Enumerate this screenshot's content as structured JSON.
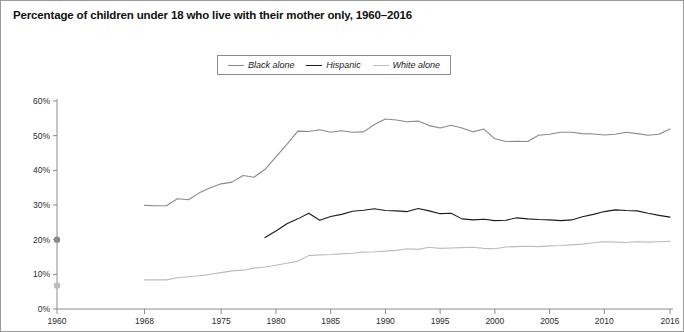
{
  "figure": {
    "title": "Percentage of children under 18 who live with their mother only, 1960–2016",
    "border_color": "#9a9a9a",
    "background": "#ffffff"
  },
  "legend": {
    "position": "top-center",
    "entries": [
      {
        "label": "Black alone",
        "color": "#8a8a8a",
        "swatch": "line-swatch"
      },
      {
        "label": "Hispanic",
        "color": "#1c1c1c",
        "swatch": "line-swatch"
      },
      {
        "label": "White alone",
        "color": "#bdbdbd",
        "swatch": "line-swatch"
      }
    ]
  },
  "axes": {
    "y": {
      "label": "",
      "ticks": [
        "0%",
        "10%",
        "20%",
        "30%",
        "40%",
        "50%",
        "60%"
      ],
      "min": 0,
      "max": 60
    },
    "x": {
      "label": "",
      "ticks": [
        "1960",
        "1968",
        "1975",
        "1980",
        "1985",
        "1990",
        "1995",
        "2000",
        "2005",
        "2010",
        "2016"
      ],
      "min": 1960,
      "max": 2016
    }
  },
  "chart_data": {
    "type": "line",
    "title": "Percentage of children under 18 who live with their mother only, 1960–2016",
    "xlabel": "",
    "ylabel": "",
    "xlim": [
      1960,
      2016
    ],
    "ylim": [
      0,
      60
    ],
    "grid": false,
    "legend_position": "top-center",
    "y_tick_values": [
      0,
      10,
      20,
      30,
      40,
      50,
      60
    ],
    "y_tick_labels": [
      "0%",
      "10%",
      "20%",
      "30%",
      "40%",
      "50%",
      "60%"
    ],
    "x_tick_values": [
      1960,
      1968,
      1975,
      1980,
      1985,
      1990,
      1995,
      2000,
      2005,
      2010,
      2016
    ],
    "x_tick_labels": [
      "1960",
      "1968",
      "1975",
      "1980",
      "1985",
      "1990",
      "1995",
      "2000",
      "2005",
      "2010",
      "2016"
    ],
    "series": [
      {
        "name": "Black alone",
        "color": "#8a8a8a",
        "marker_points": [
          {
            "x": 1960,
            "y": 20.0
          }
        ],
        "x": [
          1968,
          1969,
          1970,
          1971,
          1972,
          1973,
          1974,
          1975,
          1976,
          1977,
          1978,
          1979,
          1980,
          1981,
          1982,
          1983,
          1984,
          1985,
          1986,
          1987,
          1988,
          1989,
          1990,
          1991,
          1992,
          1993,
          1994,
          1995,
          1996,
          1997,
          1998,
          1999,
          2000,
          2001,
          2002,
          2003,
          2004,
          2005,
          2006,
          2007,
          2008,
          2009,
          2010,
          2011,
          2012,
          2013,
          2014,
          2015,
          2016
        ],
        "y": [
          29.9,
          29.8,
          29.8,
          31.8,
          31.5,
          33.5,
          35.0,
          36.1,
          36.6,
          38.5,
          38.0,
          40.3,
          43.9,
          47.5,
          51.3,
          51.2,
          51.7,
          51.0,
          51.4,
          51.0,
          51.1,
          53.2,
          54.8,
          54.5,
          54.0,
          54.2,
          52.9,
          52.2,
          53.0,
          52.2,
          51.1,
          51.9,
          49.1,
          48.3,
          48.4,
          48.3,
          50.1,
          50.4,
          51.0,
          51.0,
          50.6,
          50.5,
          50.2,
          50.4,
          51.0,
          50.6,
          50.1,
          50.4,
          51.9
        ]
      },
      {
        "name": "Hispanic",
        "color": "#1c1c1c",
        "marker_points": [],
        "x": [
          1979,
          1980,
          1981,
          1982,
          1983,
          1984,
          1985,
          1986,
          1987,
          1988,
          1989,
          1990,
          1991,
          1992,
          1993,
          1994,
          1995,
          1996,
          1997,
          1998,
          1999,
          2000,
          2001,
          2002,
          2003,
          2004,
          2005,
          2006,
          2007,
          2008,
          2009,
          2010,
          2011,
          2012,
          2013,
          2014,
          2015,
          2016
        ],
        "y": [
          20.6,
          22.5,
          24.6,
          26.0,
          27.6,
          25.6,
          26.7,
          27.3,
          28.2,
          28.5,
          28.9,
          28.4,
          28.3,
          28.1,
          29.0,
          28.3,
          27.5,
          27.6,
          26.0,
          25.7,
          25.9,
          25.5,
          25.6,
          26.3,
          26.0,
          25.8,
          25.7,
          25.5,
          25.7,
          26.6,
          27.3,
          28.1,
          28.6,
          28.4,
          28.3,
          27.6,
          27.0,
          26.5
        ]
      },
      {
        "name": "White alone",
        "color": "#bdbdbd",
        "marker_points": [
          {
            "x": 1960,
            "y": 6.8
          }
        ],
        "x": [
          1968,
          1969,
          1970,
          1971,
          1972,
          1973,
          1974,
          1975,
          1976,
          1977,
          1978,
          1979,
          1980,
          1981,
          1982,
          1983,
          1984,
          1985,
          1986,
          1987,
          1988,
          1989,
          1990,
          1991,
          1992,
          1993,
          1994,
          1995,
          1996,
          1997,
          1998,
          1999,
          2000,
          2001,
          2002,
          2003,
          2004,
          2005,
          2006,
          2007,
          2008,
          2009,
          2010,
          2011,
          2012,
          2013,
          2014,
          2015,
          2016
        ],
        "y": [
          8.4,
          8.4,
          8.4,
          9.0,
          9.3,
          9.6,
          10.0,
          10.5,
          11.0,
          11.2,
          11.8,
          12.1,
          12.6,
          13.2,
          13.8,
          15.4,
          15.6,
          15.7,
          15.9,
          16.1,
          16.4,
          16.5,
          16.7,
          16.9,
          17.4,
          17.2,
          17.8,
          17.5,
          17.6,
          17.7,
          17.8,
          17.5,
          17.4,
          17.9,
          18.0,
          18.1,
          18.0,
          18.2,
          18.3,
          18.5,
          18.7,
          19.1,
          19.4,
          19.3,
          19.2,
          19.4,
          19.3,
          19.4,
          19.5
        ]
      }
    ]
  }
}
